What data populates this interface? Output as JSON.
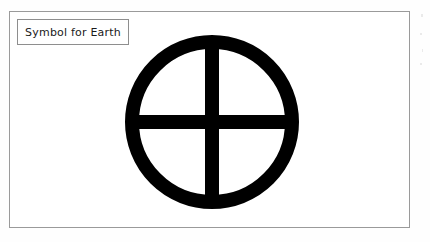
{
  "figure": {
    "caption": "Symbol for Earth",
    "symbol_name": "earth-symbol",
    "symbol_description": "circle with equal-armed cross",
    "colors": {
      "symbol_fill": "#000000",
      "page_background": "#ffffff",
      "frame_border": "#9a9a9a",
      "caption_border": "#8e8e8e",
      "caption_text": "#1a1a1a"
    }
  }
}
